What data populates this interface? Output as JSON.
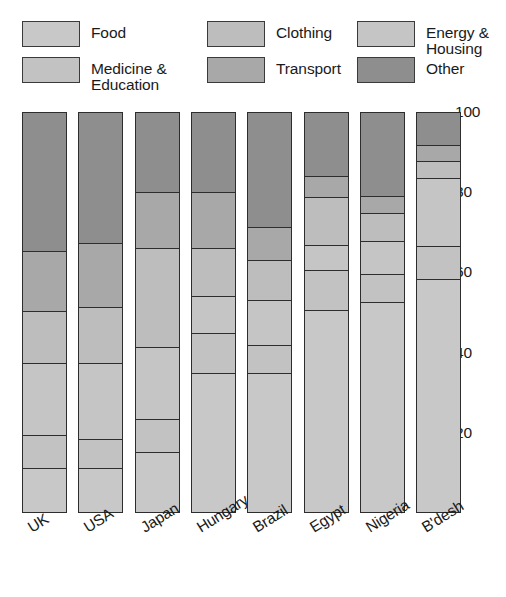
{
  "legend": {
    "items": [
      {
        "label": "Food",
        "color": "#c8c8c8",
        "col": 1,
        "row": 1
      },
      {
        "label": "Medicine &\nEducation",
        "color": "#c2c2c2",
        "col": 1,
        "row": 2
      },
      {
        "label": "Clothing",
        "color": "#bdbdbd",
        "col": 2,
        "row": 1
      },
      {
        "label": "Transport",
        "color": "#a8a8a8",
        "col": 2,
        "row": 2
      },
      {
        "label": "Energy &\nHousing",
        "color": "#c5c5c5",
        "col": 3,
        "row": 1
      },
      {
        "label": "Other",
        "color": "#8e8e8e",
        "col": 3,
        "row": 2
      }
    ]
  },
  "chart_data": {
    "type": "bar",
    "subtype": "stacked-percentage",
    "title": "",
    "xlabel": "",
    "ylabel": "",
    "ylim": [
      0,
      100
    ],
    "yticks": [
      20,
      40,
      60,
      80,
      100
    ],
    "grid": false,
    "legend_position": "top",
    "stack_order_bottom_to_top": [
      "Food",
      "Medicine & Education",
      "Energy & Housing",
      "Clothing",
      "Transport",
      "Other"
    ],
    "categories": [
      "UK",
      "USA",
      "Japan",
      "Hungary",
      "Brazil",
      "Egypt",
      "Nigeria",
      "B'desh"
    ],
    "series": [
      {
        "name": "Food",
        "color": "#c8c8c8",
        "values": [
          11,
          11,
          15,
          35,
          35,
          51,
          53,
          59
        ]
      },
      {
        "name": "Medicine & Education",
        "color": "#c2c2c2",
        "values": [
          8,
          7,
          8,
          10,
          7,
          10,
          7,
          8
        ]
      },
      {
        "name": "Energy & Housing",
        "color": "#c5c5c5",
        "values": [
          18,
          19,
          18,
          9,
          11,
          6,
          8,
          6
        ]
      },
      {
        "name": "Clothing",
        "color": "#bdbdbd",
        "values": [
          13,
          14,
          25,
          12,
          10,
          12,
          7,
          15
        ]
      },
      {
        "name": "Transport",
        "color": "#a8a8a8",
        "values": [
          15,
          16,
          14,
          14,
          8,
          5,
          4,
          4
        ]
      },
      {
        "name": "Other",
        "color": "#8e8e8e",
        "values": [
          35,
          33,
          20,
          20,
          29,
          16,
          21,
          8
        ]
      }
    ],
    "bars": [
      {
        "category": "UK",
        "segments_top_to_bottom": [
          {
            "name": "Other",
            "value": 35,
            "color": "#8e8e8e"
          },
          {
            "name": "Transport",
            "value": 15,
            "color": "#a8a8a8"
          },
          {
            "name": "Clothing",
            "value": 13,
            "color": "#bdbdbd"
          },
          {
            "name": "Energy & Housing",
            "value": 18,
            "color": "#c5c5c5"
          },
          {
            "name": "Medicine & Education",
            "value": 8,
            "color": "#c2c2c2"
          },
          {
            "name": "Food",
            "value": 11,
            "color": "#c8c8c8"
          }
        ]
      },
      {
        "category": "USA",
        "segments_top_to_bottom": [
          {
            "name": "Other",
            "value": 33,
            "color": "#8e8e8e"
          },
          {
            "name": "Transport",
            "value": 16,
            "color": "#a8a8a8"
          },
          {
            "name": "Clothing",
            "value": 14,
            "color": "#bdbdbd"
          },
          {
            "name": "Energy & Housing",
            "value": 19,
            "color": "#c5c5c5"
          },
          {
            "name": "Medicine & Education",
            "value": 7,
            "color": "#c2c2c2"
          },
          {
            "name": "Food",
            "value": 11,
            "color": "#c8c8c8"
          }
        ]
      },
      {
        "category": "Japan",
        "segments_top_to_bottom": [
          {
            "name": "Other",
            "value": 20,
            "color": "#8e8e8e"
          },
          {
            "name": "Transport",
            "value": 14,
            "color": "#a8a8a8"
          },
          {
            "name": "Clothing",
            "value": 25,
            "color": "#bdbdbd"
          },
          {
            "name": "Energy & Housing",
            "value": 18,
            "color": "#c5c5c5"
          },
          {
            "name": "Medicine & Education",
            "value": 8,
            "color": "#c2c2c2"
          },
          {
            "name": "Food",
            "value": 15,
            "color": "#c8c8c8"
          }
        ]
      },
      {
        "category": "Hungary",
        "segments_top_to_bottom": [
          {
            "name": "Other",
            "value": 20,
            "color": "#8e8e8e"
          },
          {
            "name": "Transport",
            "value": 14,
            "color": "#a8a8a8"
          },
          {
            "name": "Clothing",
            "value": 12,
            "color": "#bdbdbd"
          },
          {
            "name": "Energy & Housing",
            "value": 9,
            "color": "#c5c5c5"
          },
          {
            "name": "Medicine & Education",
            "value": 10,
            "color": "#c2c2c2"
          },
          {
            "name": "Food",
            "value": 35,
            "color": "#c8c8c8"
          }
        ]
      },
      {
        "category": "Brazil",
        "segments_top_to_bottom": [
          {
            "name": "Other",
            "value": 29,
            "color": "#8e8e8e"
          },
          {
            "name": "Transport",
            "value": 8,
            "color": "#a8a8a8"
          },
          {
            "name": "Clothing",
            "value": 10,
            "color": "#bdbdbd"
          },
          {
            "name": "Energy & Housing",
            "value": 11,
            "color": "#c5c5c5"
          },
          {
            "name": "Medicine & Education",
            "value": 7,
            "color": "#c2c2c2"
          },
          {
            "name": "Food",
            "value": 35,
            "color": "#c8c8c8"
          }
        ]
      },
      {
        "category": "Egypt",
        "segments_top_to_bottom": [
          {
            "name": "Other",
            "value": 16,
            "color": "#8e8e8e"
          },
          {
            "name": "Transport",
            "value": 5,
            "color": "#a8a8a8"
          },
          {
            "name": "Clothing",
            "value": 12,
            "color": "#bdbdbd"
          },
          {
            "name": "Energy & Housing",
            "value": 6,
            "color": "#c5c5c5"
          },
          {
            "name": "Medicine & Education",
            "value": 10,
            "color": "#c2c2c2"
          },
          {
            "name": "Food",
            "value": 51,
            "color": "#c8c8c8"
          }
        ]
      },
      {
        "category": "Nigeria",
        "segments_top_to_bottom": [
          {
            "name": "Other",
            "value": 21,
            "color": "#8e8e8e"
          },
          {
            "name": "Transport",
            "value": 4,
            "color": "#a8a8a8"
          },
          {
            "name": "Clothing",
            "value": 7,
            "color": "#bdbdbd"
          },
          {
            "name": "Energy & Housing",
            "value": 8,
            "color": "#c5c5c5"
          },
          {
            "name": "Medicine & Education",
            "value": 7,
            "color": "#c2c2c2"
          },
          {
            "name": "Food",
            "value": 53,
            "color": "#c8c8c8"
          }
        ]
      },
      {
        "category": "B'desh",
        "segments_top_to_bottom": [
          {
            "name": "Other",
            "value": 8,
            "color": "#8e8e8e"
          },
          {
            "name": "Transport",
            "value": 4,
            "color": "#a8a8a8"
          },
          {
            "name": "Clothing",
            "value": 4,
            "color": "#bdbdbd"
          },
          {
            "name": "Energy & Housing",
            "value": 17,
            "color": "#c5c5c5"
          },
          {
            "name": "Medicine & Education",
            "value": 8,
            "color": "#c2c2c2"
          },
          {
            "name": "Food",
            "value": 59,
            "color": "#c8c8c8"
          }
        ]
      }
    ]
  },
  "geometry": {
    "plot_top_px": 112,
    "plot_bottom_px": 513,
    "bar_left_start_px": 22,
    "bar_width_px": 45,
    "bar_pitch_px": 56.3,
    "xlabel_top_px": 522
  }
}
